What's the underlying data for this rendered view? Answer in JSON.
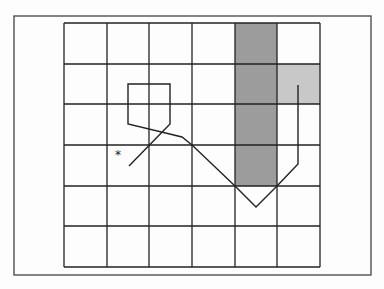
{
  "diagram": {
    "frame": {
      "x": 14,
      "y": 16,
      "width": 357,
      "height": 259
    },
    "grid": {
      "x_lines": [
        64,
        107,
        149,
        192,
        235,
        277,
        320
      ],
      "y_lines": [
        23,
        64,
        104,
        145,
        186,
        226,
        267
      ],
      "columns": 6,
      "rows": 6,
      "line_color": "#222222"
    },
    "shaded_cells": [
      {
        "name": "dark-column",
        "col": 4,
        "row_start": 0,
        "row_end": 3,
        "color": "#9c9c9c"
      },
      {
        "name": "light-cell",
        "col": 5,
        "row_start": 1,
        "row_end": 1,
        "color": "#c8c8c8"
      }
    ],
    "path": {
      "color": "#222222",
      "points": [
        [
          129,
          166
        ],
        [
          170,
          124
        ],
        [
          170,
          84
        ],
        [
          128,
          84
        ],
        [
          128,
          124
        ],
        [
          182,
          137
        ],
        [
          192,
          145
        ],
        [
          235,
          186
        ],
        [
          256,
          207
        ],
        [
          277,
          186
        ],
        [
          298,
          164
        ],
        [
          298,
          85
        ]
      ]
    },
    "marker": {
      "symbol": "*",
      "x": 118,
      "y": 153
    }
  }
}
